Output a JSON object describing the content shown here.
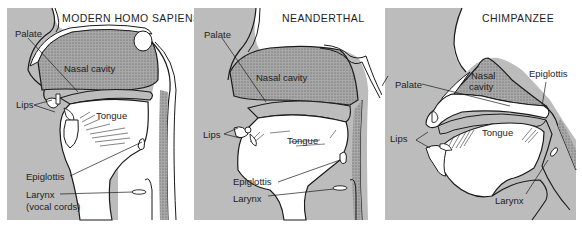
{
  "figure": {
    "colors": {
      "tissue_gray": "#b9b9b9",
      "cavity_gray": "#a9a9a9",
      "line": "#1a1a1a",
      "background": "#ffffff"
    },
    "panels": [
      {
        "title": "MODERN HOMO SAPIENS",
        "labels": {
          "palate": "Palate",
          "nasal_cavity": "Nasal cavity",
          "lips": "Lips",
          "tongue": "Tongue",
          "epiglottis": "Epiglottis",
          "larynx": "Larynx",
          "larynx_note": "(vocal cords)"
        }
      },
      {
        "title": "NEANDERTHAL",
        "labels": {
          "palate": "Palate",
          "nasal_cavity": "Nasal cavity",
          "lips": "Lips",
          "tongue": "Tongue",
          "epiglottis": "Epiglottis",
          "larynx": "Larynx"
        }
      },
      {
        "title": "CHIMPANZEE",
        "labels": {
          "palate": "Palate",
          "nasal_cavity_line1": "Nasal",
          "nasal_cavity_line2": "cavity",
          "epiglottis": "Epiglottis",
          "lips": "Lips",
          "tongue": "Tongue",
          "larynx": "Larynx"
        }
      }
    ]
  }
}
